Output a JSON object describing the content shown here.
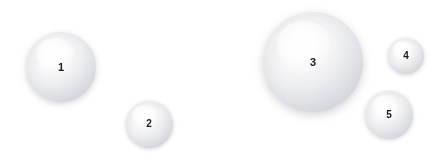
{
  "canvas": {
    "width": 447,
    "height": 164,
    "background_color": "#ffffff"
  },
  "figure": {
    "title": "",
    "sphere_count": 5
  },
  "style": {
    "sphere_center_color": "#ffffff",
    "sphere_edge_color": "#c5c6cd",
    "sphere_mid_color": "#e1e2e6",
    "shadow_color": "#78788040",
    "label_color": "#1b1b1b",
    "highlight_position": "upper-left"
  },
  "chart_data": {
    "type": "scatter",
    "title": "",
    "xlabel": "",
    "ylabel": "",
    "grid": false,
    "legend": "none",
    "xlim": [
      0,
      447
    ],
    "ylim": [
      0,
      164
    ],
    "note": "Bubble-style diagram: marker size encodes sphere diameter in pixels",
    "categories": [
      "1",
      "2",
      "3",
      "4",
      "5"
    ],
    "points": [
      {
        "label": "1",
        "cx": 61,
        "cy": 67,
        "diameter": 70,
        "radius": 35,
        "label_cx": 61,
        "label_cy": 67,
        "font_size": 11
      },
      {
        "label": "2",
        "cx": 149,
        "cy": 124,
        "diameter": 47,
        "radius": 23.5,
        "label_cx": 149,
        "label_cy": 124,
        "font_size": 10
      },
      {
        "label": "3",
        "cx": 313,
        "cy": 62,
        "diameter": 100,
        "radius": 50,
        "label_cx": 313,
        "label_cy": 62,
        "font_size": 11
      },
      {
        "label": "4",
        "cx": 406,
        "cy": 56,
        "diameter": 36,
        "radius": 18,
        "label_cx": 406,
        "label_cy": 56,
        "font_size": 10
      },
      {
        "label": "5",
        "cx": 389,
        "cy": 115,
        "diameter": 48,
        "radius": 24,
        "label_cx": 389,
        "label_cy": 115,
        "font_size": 10
      }
    ],
    "values": [
      70,
      47,
      100,
      36,
      48
    ]
  }
}
